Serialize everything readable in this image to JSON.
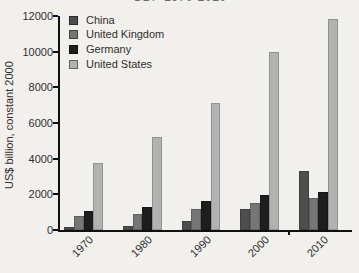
{
  "title": "GDP 1970-2010",
  "chart_data": {
    "type": "bar",
    "title": "GDP 1970-2010",
    "categories": [
      "1970",
      "1980",
      "1990",
      "2000",
      "2010"
    ],
    "series": [
      {
        "name": "China",
        "color": "#4e4e4e",
        "values": [
          150,
          220,
          490,
          1200,
          3300
        ]
      },
      {
        "name": "United Kingdom",
        "color": "#767676",
        "values": [
          800,
          890,
          1180,
          1530,
          1770
        ]
      },
      {
        "name": "Germany",
        "color": "#1e1e1e",
        "values": [
          1060,
          1310,
          1600,
          1940,
          2130
        ]
      },
      {
        "name": "United States",
        "color": "#b2b2b2",
        "values": [
          3780,
          5200,
          7120,
          9960,
          11850
        ]
      }
    ],
    "xlabel": "",
    "ylabel": "US$ billion, constant 2000",
    "ylim": [
      0,
      12000
    ],
    "yticks": [
      0,
      2000,
      4000,
      6000,
      8000,
      10000,
      12000
    ],
    "legend_position": "top-left",
    "grid": false,
    "background_color": "#f2f0ed",
    "axis_color": "#111111"
  }
}
